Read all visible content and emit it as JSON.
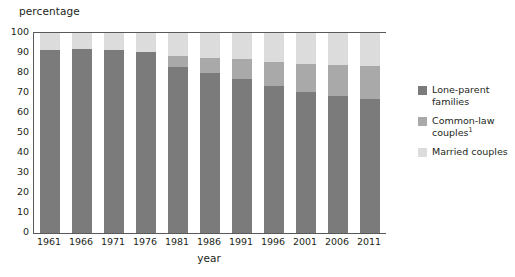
{
  "axes": {
    "ylabel": "percentage",
    "xlabel": "year",
    "yticks": [
      "100",
      "90",
      "80",
      "70",
      "60",
      "50",
      "40",
      "30",
      "20",
      "10",
      "0"
    ]
  },
  "legend": {
    "items": [
      {
        "label": "Lone-parent families",
        "color": "#7b7b7b",
        "swatch_name": "legend-swatch-lone-parent"
      },
      {
        "label": "Common-law couples",
        "footnote": "1",
        "color": "#a9a9a9",
        "swatch_name": "legend-swatch-common-law"
      },
      {
        "label": "Married couples",
        "color": "#dcdcdc",
        "swatch_name": "legend-swatch-married"
      }
    ]
  },
  "chart_data": {
    "type": "bar",
    "subtype": "stacked-bar-100",
    "title": "",
    "xlabel": "year",
    "ylabel": "percentage",
    "ylim": [
      0,
      100
    ],
    "yticks": [
      0,
      10,
      20,
      30,
      40,
      50,
      60,
      70,
      80,
      90,
      100
    ],
    "grid": false,
    "legend_position": "right",
    "categories": [
      "1961",
      "1966",
      "1971",
      "1976",
      "1981",
      "1986",
      "1991",
      "1996",
      "2001",
      "2006",
      "2011"
    ],
    "series": [
      {
        "name": "Married couples",
        "color": "#7b7b7b",
        "stack_order": 1,
        "values": [
          91.6,
          92.0,
          91.6,
          90.6,
          83.1,
          80.2,
          77.2,
          73.7,
          70.5,
          68.6,
          67.0
        ]
      },
      {
        "name": "Common-law couples",
        "color": "#a9a9a9",
        "stack_order": 2,
        "values": [
          0.0,
          0.0,
          0.0,
          0.0,
          5.6,
          7.2,
          9.9,
          11.7,
          13.8,
          15.5,
          16.7
        ]
      },
      {
        "name": "Lone-parent families",
        "color": "#dcdcdc",
        "stack_order": 3,
        "values": [
          8.4,
          8.0,
          8.4,
          9.4,
          11.3,
          12.6,
          12.9,
          14.6,
          15.7,
          15.9,
          16.3
        ]
      }
    ]
  }
}
